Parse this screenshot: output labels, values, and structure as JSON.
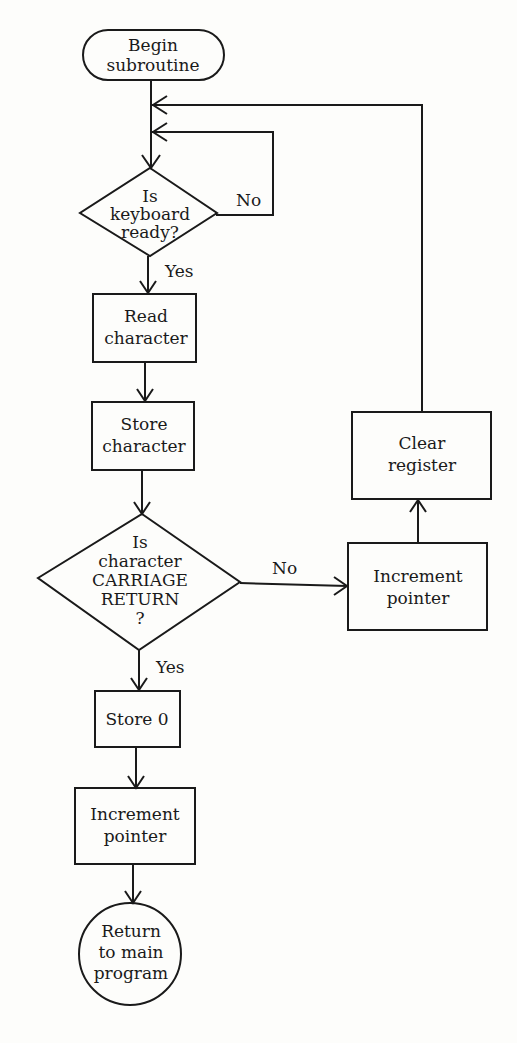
{
  "diagram": {
    "type": "flowchart",
    "nodes": {
      "begin": {
        "shape": "terminator",
        "lines": [
          "Begin",
          "subroutine"
        ]
      },
      "keyboard_ready": {
        "shape": "decision",
        "lines": [
          "Is",
          "keyboard",
          "ready?"
        ]
      },
      "read_char": {
        "shape": "process",
        "lines": [
          "Read",
          "character"
        ]
      },
      "store_char": {
        "shape": "process",
        "lines": [
          "Store",
          "character"
        ]
      },
      "is_cr": {
        "shape": "decision",
        "lines": [
          "Is",
          "character",
          "CARRIAGE",
          "RETURN",
          "?"
        ]
      },
      "store_zero": {
        "shape": "process",
        "lines": [
          "Store 0"
        ]
      },
      "inc_pointer_main": {
        "shape": "process",
        "lines": [
          "Increment",
          "pointer"
        ]
      },
      "return_main": {
        "shape": "connector",
        "lines": [
          "Return",
          "to main",
          "program"
        ]
      },
      "inc_pointer_loop": {
        "shape": "process",
        "lines": [
          "Increment",
          "pointer"
        ]
      },
      "clear_register": {
        "shape": "process",
        "lines": [
          "Clear",
          "register"
        ]
      }
    },
    "edge_labels": {
      "keyboard_no": "No",
      "keyboard_yes": "Yes",
      "cr_no": "No",
      "cr_yes": "Yes"
    },
    "edges": [
      {
        "from": "begin",
        "to": "keyboard_ready"
      },
      {
        "from": "keyboard_ready",
        "to": "keyboard_ready",
        "label": "No"
      },
      {
        "from": "keyboard_ready",
        "to": "read_char",
        "label": "Yes"
      },
      {
        "from": "read_char",
        "to": "store_char"
      },
      {
        "from": "store_char",
        "to": "is_cr"
      },
      {
        "from": "is_cr",
        "to": "inc_pointer_loop",
        "label": "No"
      },
      {
        "from": "is_cr",
        "to": "store_zero",
        "label": "Yes"
      },
      {
        "from": "inc_pointer_loop",
        "to": "clear_register"
      },
      {
        "from": "clear_register",
        "to": "keyboard_ready"
      },
      {
        "from": "store_zero",
        "to": "inc_pointer_main"
      },
      {
        "from": "inc_pointer_main",
        "to": "return_main"
      }
    ]
  }
}
